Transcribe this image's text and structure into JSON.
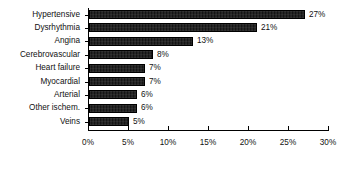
{
  "chart_data": {
    "type": "bar",
    "orientation": "horizontal",
    "title": "",
    "subtitle": "",
    "xlabel": "",
    "ylabel": "",
    "xlim": [
      0,
      30
    ],
    "grid": false,
    "legend": null,
    "xtick_labels": [
      "0%",
      "5%",
      "10%",
      "15%",
      "20%",
      "25%",
      "30%"
    ],
    "xtick_values": [
      0,
      5,
      10,
      15,
      20,
      25,
      30
    ],
    "categories": [
      "Hypertensive",
      "Dysrhythmia",
      "Angina",
      "Cerebrovascular",
      "Heart failure",
      "Myocardial",
      "Arterial",
      "Other ischem.",
      "Veins"
    ],
    "values": [
      27,
      21,
      13,
      8,
      7,
      7,
      6,
      6,
      5
    ],
    "data_labels": [
      "27%",
      "21%",
      "13%",
      "8%",
      "7%",
      "7%",
      "6%",
      "6%",
      "5%"
    ],
    "bar_color": "#141414",
    "bar_edge_color": "#000000",
    "axis_color": "#000000",
    "text_color": "#111111",
    "background_color": "#ffffff"
  }
}
